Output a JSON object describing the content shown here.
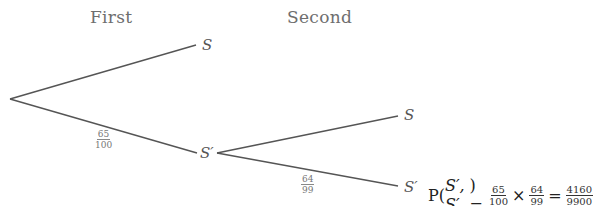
{
  "headings": {
    "first": "First",
    "second": "Second"
  },
  "nodes": {
    "first_s": "S",
    "first_s_prime": "S′",
    "second_s": "S",
    "second_s_prime": "S′"
  },
  "branch_labels": {
    "root_to_s_prime": {
      "num": "65",
      "den": "100"
    },
    "s_prime_to_s_prime": {
      "num": "64",
      "den": "99"
    }
  },
  "formula": {
    "prefix": "P(",
    "args": "S′, S′",
    "suffix": ") =",
    "f1": {
      "num": "65",
      "den": "100"
    },
    "times": "×",
    "f2": {
      "num": "64",
      "den": "99"
    },
    "equals": "=",
    "result": {
      "num": "4160",
      "den": "9900"
    }
  },
  "colors": {
    "line": "#555555",
    "heading": "#6e6e6e"
  }
}
